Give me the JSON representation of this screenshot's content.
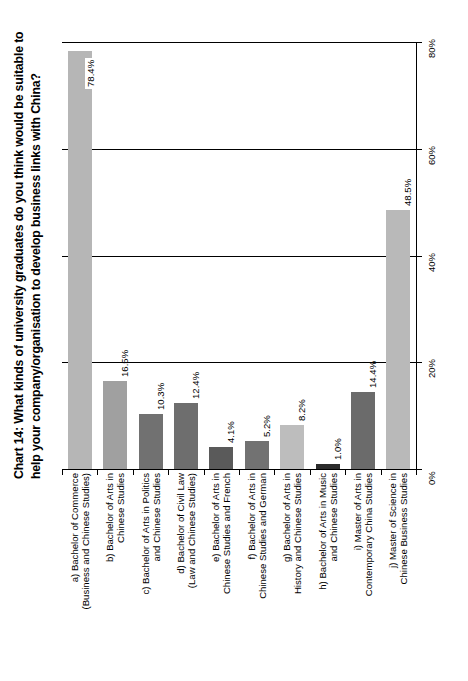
{
  "title": {
    "line1": "Chart 14:  What kinds of university graduates do you think would be suitable to",
    "line2": "help your company/organisation to develop business links with China?"
  },
  "axis": {
    "ticks": [
      "0%",
      "20%",
      "40%",
      "60%",
      "80%"
    ],
    "min": 0,
    "max": 80
  },
  "chart_data": {
    "type": "bar",
    "title": "Chart 14:  What kinds of university graduates do you think would be suitable to help your company/organisation to develop business links with China?",
    "xlabel": "",
    "ylabel": "",
    "ylim": [
      0,
      80
    ],
    "ytick_labels": [
      "0%",
      "20%",
      "40%",
      "60%",
      "80%"
    ],
    "ytick_values": [
      0,
      20,
      40,
      60,
      80
    ],
    "grid": true,
    "legend": "none",
    "orientation": "vertical-bars-rotated-page",
    "categories": [
      "a) Bachelor of Commerce (Business and Chinese Studies)",
      "b) Bachelor of Arts in Chinese Studies",
      "c) Bachelor of Arts in Politics and Chinese Studies",
      "d) Bachelor of Civil Law (Law and Chinese Studies)",
      "e) Bachelor of Arts in Chinese Studies and French",
      "f) Bachelor of Arts in Chinese Studies and German",
      "g) Bachelor of Arts in History and Chinese Studies",
      "h) Bachelor of Arts in Music and Chinese Studies",
      "i) Master of Arts in Contemporary China Studies",
      "j) Master of Science in Chinese Business Studies"
    ],
    "values": [
      78.4,
      16.5,
      10.3,
      12.4,
      4.1,
      5.2,
      8.2,
      1.0,
      14.4,
      48.5
    ],
    "data_labels": [
      "78.4%",
      "16.5%",
      "10.3%",
      "12.4%",
      "4.1%",
      "5.2%",
      "8.2%",
      "1.0%",
      "14.4%",
      "48.5%"
    ],
    "bar_colors": [
      "#b6b6b6",
      "#a0a0a0",
      "#717171",
      "#6e6e6e",
      "#5a5a5a",
      "#727272",
      "#bdbdbd",
      "#2b2b2b",
      "#6b6b6b",
      "#b9b9b9"
    ]
  },
  "category_labels": [
    {
      "l1": "a) Bachelor of Commerce",
      "l2": "(Business and Chinese Studies)"
    },
    {
      "l1": "b) Bachelor of Arts in",
      "l2": "Chinese Studies"
    },
    {
      "l1": "c) Bachelor of Arts in Politics",
      "l2": "and Chinese Studies"
    },
    {
      "l1": "d) Bachelor of Civil Law",
      "l2": "(Law and Chinese Studies)"
    },
    {
      "l1": "e) Bachelor of Arts in",
      "l2": "Chinese Studies and French"
    },
    {
      "l1": "f) Bachelor of Arts in",
      "l2": "Chinese Studies and German"
    },
    {
      "l1": "g) Bachelor of Arts in",
      "l2": "History and Chinese Studies"
    },
    {
      "l1": "h) Bachelor of Arts in Music",
      "l2": "and Chinese Studies"
    },
    {
      "l1": "i) Master of Arts in",
      "l2": "Contemporary China Studies"
    },
    {
      "l1": "j) Master of Science in",
      "l2": "Chinese Business Studies"
    }
  ]
}
